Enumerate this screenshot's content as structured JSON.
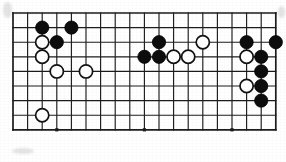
{
  "figure": {
    "kind": "go-board-diagram",
    "caption": "",
    "board": {
      "columns": 19,
      "rows": 9,
      "origin_x": 13,
      "origin_y": 13,
      "cell_size": 14.6,
      "line_color": "#1c1c1c",
      "edge_line_width": 1.7,
      "inner_line_width": 1.15,
      "background_color": "#ffffff"
    },
    "star_points": [
      {
        "col": 3,
        "row": 8
      },
      {
        "col": 9,
        "row": 8
      },
      {
        "col": 15,
        "row": 8
      },
      {
        "col": 9,
        "row": 3
      }
    ],
    "stones": [
      {
        "color": "black",
        "col": 2,
        "row": 1,
        "label": ""
      },
      {
        "color": "black",
        "col": 4,
        "row": 1,
        "label": ""
      },
      {
        "color": "black",
        "col": 3,
        "row": 2,
        "label": ""
      },
      {
        "color": "black",
        "col": 10,
        "row": 2,
        "label": ""
      },
      {
        "color": "black",
        "col": 16,
        "row": 2,
        "label": ""
      },
      {
        "color": "black",
        "col": 18,
        "row": 2,
        "label": ""
      },
      {
        "color": "black",
        "col": 9,
        "row": 3,
        "label": ""
      },
      {
        "color": "black",
        "col": 10,
        "row": 3,
        "label": ""
      },
      {
        "color": "black",
        "col": 17,
        "row": 3,
        "label": ""
      },
      {
        "color": "black",
        "col": 17,
        "row": 4,
        "label": ""
      },
      {
        "color": "black",
        "col": 17,
        "row": 5,
        "label": ""
      },
      {
        "color": "black",
        "col": 17,
        "row": 6,
        "label": ""
      },
      {
        "color": "white",
        "col": 2,
        "row": 2,
        "label": ""
      },
      {
        "color": "white",
        "col": 2,
        "row": 3,
        "label": ""
      },
      {
        "color": "white",
        "col": 3,
        "row": 4,
        "label": ""
      },
      {
        "color": "white",
        "col": 5,
        "row": 4,
        "label": ""
      },
      {
        "color": "white",
        "col": 13,
        "row": 2,
        "label": ""
      },
      {
        "color": "white",
        "col": 16,
        "row": 3,
        "label": ""
      },
      {
        "color": "white",
        "col": 11,
        "row": 3,
        "label": ""
      },
      {
        "color": "white",
        "col": 12,
        "row": 3,
        "label": ""
      },
      {
        "color": "white",
        "col": 16,
        "row": 5,
        "label": ""
      },
      {
        "color": "white",
        "col": 2,
        "row": 7,
        "label": ""
      }
    ],
    "stone_radius": 6.6,
    "colors": {
      "black_stone": "#0d0d0d",
      "white_stone_fill": "#ffffff",
      "white_stone_edge": "#121212",
      "grid": "#1c1c1c",
      "page": "#ffffff"
    }
  }
}
